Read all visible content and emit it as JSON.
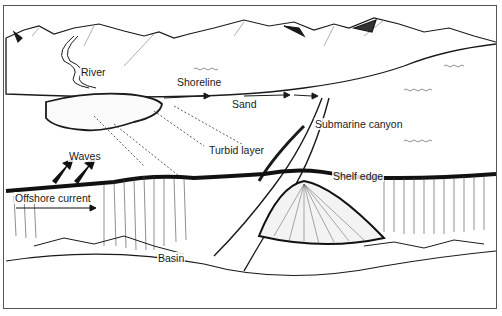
{
  "diagram": {
    "type": "illustration",
    "labels": {
      "river": "River",
      "shoreline": "Shoreline",
      "sand": "Sand",
      "submarine_canyon": "Submarine canyon",
      "turbid_layer": "Turbid layer",
      "waves": "Waves",
      "shelf_edge": "Shelf edge",
      "offshore_current": "Offshore current",
      "basin": "Basin"
    },
    "colors": {
      "ink": "#1a1a1a",
      "paper": "#ffffff"
    }
  }
}
